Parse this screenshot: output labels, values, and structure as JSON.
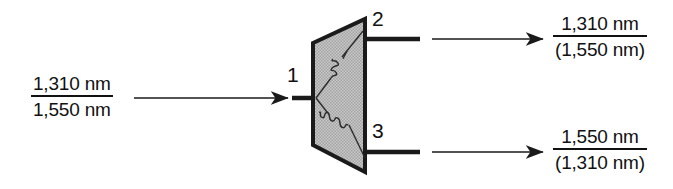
{
  "diagram": {
    "device": {
      "name": "wdm-coupler-body",
      "shape": "trapezoid",
      "fill_color": "#b9b9b9",
      "stroke_color": "#1a1a1a"
    },
    "input": {
      "port_label": "1",
      "signal": {
        "numerator": "1,310 nm",
        "denominator": "1,550 nm"
      }
    },
    "outputs": [
      {
        "port_label": "2",
        "signal": {
          "numerator": "1,310 nm",
          "denominator": "(1,550 nm)"
        }
      },
      {
        "port_label": "3",
        "signal": {
          "numerator": "1,550 nm",
          "denominator": "(1,310 nm)"
        }
      }
    ],
    "icons": {
      "input_arrow": "arrow-right-icon",
      "output_arrow_top": "arrow-right-icon",
      "output_arrow_bottom": "arrow-right-icon",
      "waveguide_top": "wavy-line-icon",
      "waveguide_bottom": "wavy-line-icon"
    }
  }
}
